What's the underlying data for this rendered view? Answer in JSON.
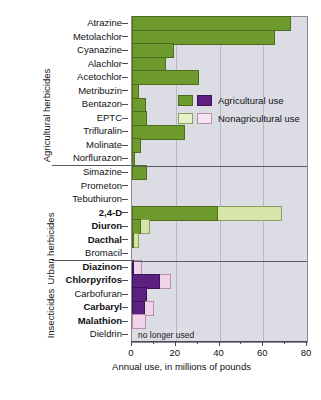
{
  "chart_data": {
    "type": "bar",
    "orientation": "horizontal",
    "title": "",
    "xlabel": "Annual use, in millions of pounds",
    "ylabel": "",
    "xlim": [
      0,
      80
    ],
    "xticks": [
      0,
      20,
      40,
      60,
      80
    ],
    "xticklabels": [
      "0",
      "20",
      "40",
      "60",
      "80"
    ],
    "grid": "vertical",
    "legend_position": "inside-upper-right",
    "legend": [
      {
        "label": "Agricultural use",
        "colors": [
          "#6f9b2e",
          "#5b2080"
        ]
      },
      {
        "label": "Nonagricultural use",
        "colors": [
          "#e8f0c8",
          "#f7e4f2"
        ]
      }
    ],
    "series": [
      {
        "name": "Agricultural use"
      },
      {
        "name": "Nonagricultural use"
      }
    ],
    "groups": [
      {
        "name": "Agricultural herbicides",
        "palette": "green",
        "categories": [
          {
            "label": "Atrazine",
            "bold": false,
            "agricultural": 72.5,
            "nonagricultural": 0
          },
          {
            "label": "Metolachlor",
            "bold": false,
            "agricultural": 65.5,
            "nonagricultural": 0
          },
          {
            "label": "Cyanazine",
            "bold": false,
            "agricultural": 19.0,
            "nonagricultural": 0
          },
          {
            "label": "Alachlor",
            "bold": false,
            "agricultural": 15.5,
            "nonagricultural": 0
          },
          {
            "label": "Acetochlor",
            "bold": false,
            "agricultural": 30.5,
            "nonagricultural": 0
          },
          {
            "label": "Metribuzin",
            "bold": false,
            "agricultural": 3.0,
            "nonagricultural": 0
          },
          {
            "label": "Bentazon",
            "bold": false,
            "agricultural": 6.5,
            "nonagricultural": 0
          },
          {
            "label": "EPTC",
            "bold": false,
            "agricultural": 7.0,
            "nonagricultural": 0
          },
          {
            "label": "Trifluralin",
            "bold": false,
            "agricultural": 24.0,
            "nonagricultural": 0
          },
          {
            "label": "Molinate",
            "bold": false,
            "agricultural": 4.0,
            "nonagricultural": 0
          },
          {
            "label": "Norflurazon",
            "bold": false,
            "agricultural": 1.5,
            "nonagricultural": 0
          }
        ]
      },
      {
        "name": "Urban herbicides",
        "palette": "green",
        "categories": [
          {
            "label": "Simazine",
            "bold": false,
            "agricultural": 7.0,
            "nonagricultural": 0
          },
          {
            "label": "Prometon",
            "bold": false,
            "agricultural": 0,
            "nonagricultural": 0
          },
          {
            "label": "Tebuthiuron",
            "bold": false,
            "agricultural": 0,
            "nonagricultural": 0
          },
          {
            "label": "2,4-D",
            "bold": true,
            "agricultural": 39.5,
            "nonagricultural": 29.0
          },
          {
            "label": "Diuron",
            "bold": true,
            "agricultural": 4.0,
            "nonagricultural": 4.0
          },
          {
            "label": "Dacthal",
            "bold": true,
            "agricultural": 1.0,
            "nonagricultural": 2.0
          },
          {
            "label": "Bromacil",
            "bold": false,
            "agricultural": 0,
            "nonagricultural": 0
          }
        ]
      },
      {
        "name": "Insecticides",
        "palette": "purple",
        "categories": [
          {
            "label": "Diazinon",
            "bold": true,
            "agricultural": 1.0,
            "nonagricultural": 3.5
          },
          {
            "label": "Chlorpyrifos",
            "bold": true,
            "agricultural": 13.0,
            "nonagricultural": 5.0
          },
          {
            "label": "Carbofuran",
            "bold": false,
            "agricultural": 7.0,
            "nonagricultural": 0
          },
          {
            "label": "Carbaryl",
            "bold": true,
            "agricultural": 6.0,
            "nonagricultural": 4.0
          },
          {
            "label": "Malathion",
            "bold": true,
            "agricultural": 0,
            "nonagricultural": 6.5
          },
          {
            "label": "Dieldrin",
            "bold": false,
            "agricultural": 0,
            "nonagricultural": 0,
            "note": "no longer used"
          }
        ]
      }
    ]
  },
  "colors": {
    "agricultural_green": "#6f9b2e",
    "nonagricultural_green": "#d5e6a8",
    "agricultural_purple": "#5b2080",
    "nonagricultural_purple": "#f0d5ea",
    "plot_background": "#dcdce4",
    "gridline": "#b9b9c6"
  }
}
